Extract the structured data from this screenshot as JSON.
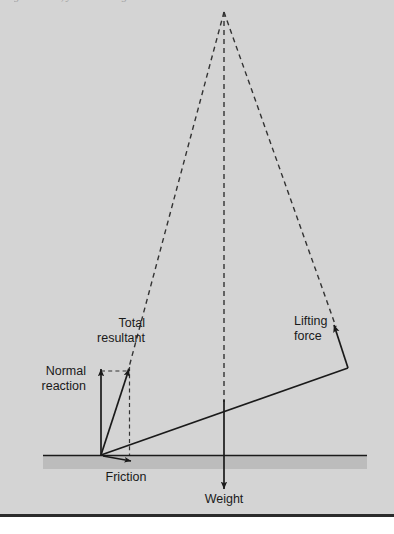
{
  "figure": {
    "caption_clipped": "g the same, you are doing less work",
    "panel_color": "#d4d4d4",
    "ground_band_color": "#bcbcbc",
    "stroke_color": "#1a1a1a",
    "rule_color": "#2b2b2b"
  },
  "labels": {
    "total_resultant": "Total\nresultant",
    "normal_reaction": "Normal\nreaction",
    "lifting_force": "Lifting\nforce",
    "friction": "Friction",
    "weight": "Weight"
  },
  "vectors": [
    {
      "name": "normal-reaction",
      "label": "Normal reaction",
      "direction": "up",
      "style": "solid"
    },
    {
      "name": "total-resultant",
      "label": "Total resultant",
      "direction": "up-right",
      "style": "solid"
    },
    {
      "name": "lifting-force",
      "label": "Lifting force",
      "direction": "up-left",
      "style": "solid"
    },
    {
      "name": "friction",
      "label": "Friction",
      "direction": "right",
      "style": "solid"
    },
    {
      "name": "weight",
      "label": "Weight",
      "direction": "down",
      "style": "solid"
    }
  ],
  "construction": {
    "apex": {
      "x": 224,
      "y": 12
    },
    "pivot": {
      "x": 101,
      "y": 455
    },
    "ground_y": 455,
    "dashed_lines": [
      {
        "name": "apex-to-left",
        "from": [
          224,
          12
        ],
        "to": [
          128,
          371
        ]
      },
      {
        "name": "apex-to-center",
        "from": [
          224,
          12
        ],
        "to": [
          224,
          400
        ]
      },
      {
        "name": "apex-to-right",
        "from": [
          224,
          12
        ],
        "to": [
          336,
          326
        ]
      },
      {
        "name": "vertical-drop",
        "from": [
          129,
          371
        ],
        "to": [
          129,
          455
        ]
      },
      {
        "name": "horizontal-tie",
        "from": [
          101,
          371
        ],
        "to": [
          129,
          371
        ]
      }
    ]
  }
}
